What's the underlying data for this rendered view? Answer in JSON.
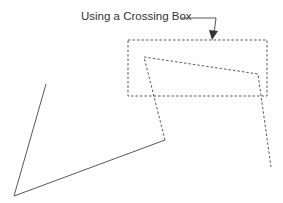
{
  "diagram": {
    "caption": "Using a Crossing Box",
    "colors": {
      "line": "#444444",
      "text": "#333333",
      "background": "#ffffff"
    },
    "crossing_box": {
      "x": 128,
      "y": 40,
      "width": 139,
      "height": 56,
      "style": "dashed"
    },
    "selected_polyline": {
      "points": "165,140 144,57 258,74 271,167",
      "style": "dashed"
    },
    "unselected_polyline": {
      "points": "46,84 14,196 165,140",
      "style": "solid"
    },
    "leader": {
      "points": "181,18 216,18 214,34",
      "arrow_tip": [
        213,
        38
      ]
    }
  }
}
